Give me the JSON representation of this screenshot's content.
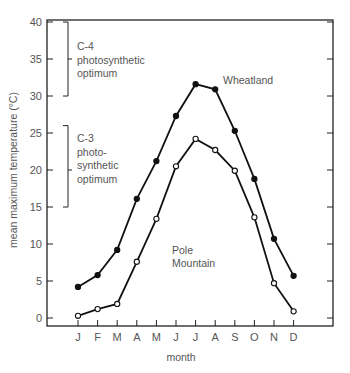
{
  "chart_data": {
    "type": "line",
    "title": "",
    "xlabel": "month",
    "ylabel": "mean maximum temperature (°C)",
    "categories": [
      "J",
      "F",
      "M",
      "A",
      "M",
      "J",
      "J",
      "A",
      "S",
      "O",
      "N",
      "D"
    ],
    "ylim": [
      0,
      40
    ],
    "yticks": [
      0,
      5,
      10,
      15,
      20,
      25,
      30,
      35,
      40
    ],
    "grid": false,
    "legend": "inline labels",
    "series": [
      {
        "name": "Wheatland",
        "marker": "filled-circle",
        "values": [
          4.2,
          5.8,
          9.2,
          16.1,
          21.2,
          27.3,
          31.6,
          30.9,
          25.3,
          18.8,
          10.7,
          5.7
        ]
      },
      {
        "name": "Pole Mountain",
        "marker": "open-circle",
        "values": [
          0.3,
          1.2,
          1.9,
          7.6,
          13.4,
          20.5,
          24.2,
          22.7,
          19.9,
          13.6,
          4.7,
          0.9
        ]
      }
    ],
    "annotations": [
      {
        "label_lines": [
          "C-4",
          "photosynthetic",
          "optimum"
        ],
        "range": [
          30,
          40
        ]
      },
      {
        "label_lines": [
          "C-3",
          "photo-",
          "synthetic",
          "optimum"
        ],
        "range": [
          15,
          26
        ]
      }
    ],
    "series_labels": [
      {
        "lines": [
          "Wheatland"
        ]
      },
      {
        "lines": [
          "Pole",
          "Mountain"
        ]
      }
    ]
  }
}
